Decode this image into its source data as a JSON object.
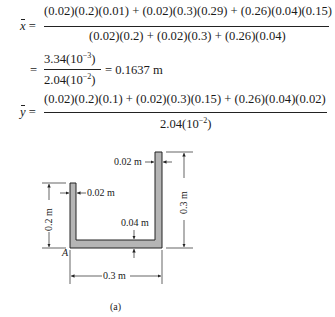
{
  "equations": {
    "xbar": {
      "lhs": "x",
      "numerator": "(0.02)(0.2)(0.01) + (0.02)(0.3)(0.29) + (0.26)(0.04)(0.15)",
      "denominator": "(0.02)(0.2) + (0.02)(0.3) + (0.26)(0.04)"
    },
    "xbar_result": {
      "num_mant": "3.34(10",
      "num_exp": "−3",
      "den_mant": "2.04(10",
      "den_exp": "−2",
      "close": ")",
      "result": "= 0.1637 m"
    },
    "ybar": {
      "lhs": "y",
      "numerator": "(0.02)(0.2)(0.1) + (0.02)(0.3)(0.15) + (0.26)(0.04)(0.02)",
      "den_mant": "2.04(10",
      "den_exp": "−2",
      "close": ")"
    },
    "equals": "=",
    "equals_prefix": "="
  },
  "figure": {
    "dims": {
      "left_flange_thickness": "0.02 m",
      "right_flange_thickness": "0.02 m",
      "left_height": "0.2 m",
      "right_height": "0.3 m",
      "web_thickness": "0.04 m",
      "width": "0.3 m"
    },
    "point_label": "A",
    "caption": "(a)",
    "fill_color": "#b5b5b5",
    "stroke_color": "#222222"
  }
}
